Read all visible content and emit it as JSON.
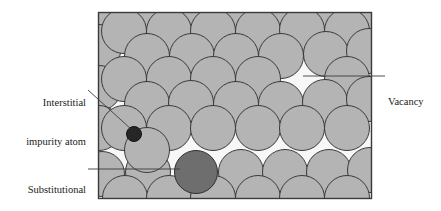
{
  "figure": {
    "type": "diagram",
    "canvas": {
      "width": 441,
      "height": 211
    },
    "frame": {
      "name": "crystal-region-box",
      "x": 98,
      "y": 12,
      "width": 274,
      "height": 187,
      "stroke": "#3a3a3a",
      "fill": "#f7f7f7"
    },
    "colors": {
      "host_atom_fill": "#b4b4b4",
      "host_atom_stroke": "#3a3a3a",
      "substitutional_fill": "#6e6e6e",
      "interstitial_fill": "#262626",
      "background": "#f7f7f7",
      "leader_line": "#3a3a3a",
      "text": "#1a1a1a"
    },
    "labels": [
      {
        "name": "interstitial-impurity-atom",
        "line1": "Interstitial",
        "line2": "impurity atom",
        "align": "right",
        "leader": {
          "type": "diagonal",
          "x1": 88,
          "y1": 90,
          "x2": 131,
          "y2": 129
        }
      },
      {
        "name": "substitutional-impurity-atom",
        "line1": "Substitutional",
        "line2": "impurity atom",
        "align": "right",
        "leader": {
          "type": "horizontal",
          "x1": 88,
          "y1": 169,
          "x2": 180,
          "y2": 169
        }
      },
      {
        "name": "vacancy",
        "line1": "Vacancy",
        "line2": "",
        "align": "left",
        "leader": {
          "type": "horizontal",
          "x1": 303,
          "y1": 76,
          "x2": 385,
          "y2": 76
        }
      }
    ],
    "atoms": {
      "radius_host": 22.5,
      "radius_substitutional": 21.5,
      "radius_interstitial": 7.5,
      "host_positions": [
        [
          101,
          8
        ],
        [
          146,
          6
        ],
        [
          190,
          8
        ],
        [
          235,
          6
        ],
        [
          280,
          8
        ],
        [
          325,
          6
        ],
        [
          368,
          8
        ],
        [
          101,
          45
        ],
        [
          124,
          30
        ],
        [
          168,
          30
        ],
        [
          212,
          30
        ],
        [
          257,
          30
        ],
        [
          301,
          29
        ],
        [
          345,
          30
        ],
        [
          146,
          55
        ],
        [
          190,
          55
        ],
        [
          235,
          55
        ],
        [
          280,
          55
        ],
        [
          325,
          53
        ],
        [
          368,
          50
        ],
        [
          101,
          85
        ],
        [
          124,
          78
        ],
        [
          168,
          78
        ],
        [
          212,
          78
        ],
        [
          257,
          78
        ],
        [
          345,
          78
        ],
        [
          146,
          104
        ],
        [
          190,
          102
        ],
        [
          235,
          104
        ],
        [
          280,
          104
        ],
        [
          324,
          101
        ],
        [
          368,
          98
        ],
        [
          101,
          126
        ],
        [
          124,
          126
        ],
        [
          168,
          126
        ],
        [
          212,
          126
        ],
        [
          257,
          126
        ],
        [
          301,
          126
        ],
        [
          345,
          126
        ],
        [
          146,
          150
        ],
        [
          102,
          172
        ],
        [
          147,
          172
        ],
        [
          240,
          172
        ],
        [
          284,
          172
        ],
        [
          328,
          172
        ],
        [
          369,
          170
        ],
        [
          125,
          196
        ],
        [
          168,
          196
        ],
        [
          212,
          196
        ],
        [
          257,
          196
        ],
        [
          301,
          196
        ],
        [
          345,
          196
        ],
        [
          370,
          196
        ]
      ],
      "substitutional_position": [
        196,
        172
      ],
      "interstitial_position": [
        134,
        134
      ],
      "vacancy_position": [
        301,
        78
      ]
    }
  }
}
